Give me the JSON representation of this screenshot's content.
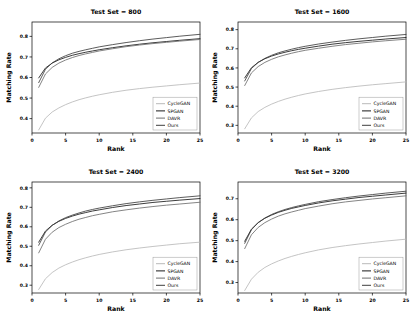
{
  "figure": {
    "type": "multi-panel-line-chart",
    "panel_count": 4,
    "layout": "2x2",
    "background": "#ffffff"
  },
  "axis": {
    "xlabel": "Rank",
    "ylabel": "Matching Rate",
    "xticks": [
      "0",
      "5",
      "10",
      "15",
      "20",
      "25"
    ],
    "xlim": [
      0,
      25
    ]
  },
  "legend": {
    "position": "lower-right",
    "entries": [
      {
        "label": "CycleGAN",
        "color": "#b9b9b9"
      },
      {
        "label": "SPGAN",
        "color": "#1a1a1a"
      },
      {
        "label": "DAVR",
        "color": "#6e6e6e"
      },
      {
        "label": "Ours",
        "color": "#3f3f3f"
      }
    ]
  },
  "chart_data": [
    {
      "type": "line",
      "title": "Test Set = 800",
      "xlabel": "Rank",
      "ylabel": "Matching Rate",
      "xlim": [
        0,
        25
      ],
      "ylim": [
        0.33,
        0.87
      ],
      "yticks": [
        0.4,
        0.5,
        0.6,
        0.7,
        0.8
      ],
      "ytick_labels": [
        "0.4",
        "0.5",
        "0.6",
        "0.7",
        "0.8"
      ],
      "grid": false,
      "x": [
        1,
        2,
        3,
        4,
        5,
        6,
        7,
        8,
        9,
        10,
        12,
        14,
        16,
        18,
        20,
        22,
        25
      ],
      "series": [
        {
          "name": "CycleGAN",
          "color": "#b9b9b9",
          "values": [
            0.345,
            0.402,
            0.432,
            0.452,
            0.468,
            0.481,
            0.492,
            0.501,
            0.509,
            0.516,
            0.528,
            0.538,
            0.546,
            0.553,
            0.559,
            0.565,
            0.573
          ]
        },
        {
          "name": "SPGAN",
          "color": "#1a1a1a",
          "values": [
            0.598,
            0.646,
            0.67,
            0.686,
            0.698,
            0.708,
            0.716,
            0.723,
            0.729,
            0.735,
            0.745,
            0.754,
            0.762,
            0.769,
            0.775,
            0.781,
            0.789
          ]
        },
        {
          "name": "DAVR",
          "color": "#6e6e6e",
          "values": [
            0.552,
            0.617,
            0.649,
            0.67,
            0.685,
            0.697,
            0.707,
            0.715,
            0.722,
            0.729,
            0.74,
            0.75,
            0.758,
            0.765,
            0.771,
            0.777,
            0.785
          ]
        },
        {
          "name": "Ours",
          "color": "#3f3f3f",
          "values": [
            0.575,
            0.64,
            0.671,
            0.691,
            0.706,
            0.718,
            0.727,
            0.735,
            0.742,
            0.749,
            0.76,
            0.77,
            0.779,
            0.787,
            0.794,
            0.801,
            0.81
          ]
        }
      ]
    },
    {
      "type": "line",
      "title": "Test Set = 1600",
      "xlabel": "Rank",
      "ylabel": "Matching Rate",
      "xlim": [
        0,
        25
      ],
      "ylim": [
        0.26,
        0.84
      ],
      "yticks": [
        0.3,
        0.4,
        0.5,
        0.6,
        0.7,
        0.8
      ],
      "ytick_labels": [
        "0.3",
        "0.4",
        "0.5",
        "0.6",
        "0.7",
        "0.8"
      ],
      "grid": false,
      "x": [
        1,
        2,
        3,
        4,
        5,
        6,
        7,
        8,
        9,
        10,
        12,
        14,
        16,
        18,
        20,
        22,
        25
      ],
      "series": [
        {
          "name": "CycleGAN",
          "color": "#b9b9b9",
          "values": [
            0.282,
            0.339,
            0.372,
            0.394,
            0.411,
            0.425,
            0.437,
            0.447,
            0.456,
            0.464,
            0.477,
            0.488,
            0.497,
            0.505,
            0.512,
            0.518,
            0.527
          ]
        },
        {
          "name": "SPGAN",
          "color": "#1a1a1a",
          "values": [
            0.548,
            0.601,
            0.629,
            0.648,
            0.662,
            0.673,
            0.682,
            0.69,
            0.697,
            0.703,
            0.714,
            0.724,
            0.732,
            0.739,
            0.745,
            0.751,
            0.759
          ]
        },
        {
          "name": "DAVR",
          "color": "#6e6e6e",
          "values": [
            0.508,
            0.574,
            0.607,
            0.629,
            0.645,
            0.658,
            0.668,
            0.677,
            0.685,
            0.692,
            0.703,
            0.713,
            0.722,
            0.729,
            0.736,
            0.742,
            0.75
          ]
        },
        {
          "name": "Ours",
          "color": "#3f3f3f",
          "values": [
            0.532,
            0.597,
            0.629,
            0.65,
            0.666,
            0.679,
            0.689,
            0.698,
            0.706,
            0.713,
            0.725,
            0.735,
            0.744,
            0.752,
            0.759,
            0.766,
            0.775
          ]
        }
      ]
    },
    {
      "type": "line",
      "title": "Test Set = 2400",
      "xlabel": "Rank",
      "ylabel": "Matching Rate",
      "xlim": [
        0,
        25
      ],
      "ylim": [
        0.26,
        0.83
      ],
      "yticks": [
        0.3,
        0.4,
        0.5,
        0.6,
        0.7,
        0.8
      ],
      "ytick_labels": [
        "0.3",
        "0.4",
        "0.5",
        "0.6",
        "0.7",
        "0.8"
      ],
      "grid": false,
      "x": [
        1,
        2,
        3,
        4,
        5,
        6,
        7,
        8,
        9,
        10,
        12,
        14,
        16,
        18,
        20,
        22,
        25
      ],
      "series": [
        {
          "name": "CycleGAN",
          "color": "#b9b9b9",
          "values": [
            0.278,
            0.333,
            0.365,
            0.388,
            0.405,
            0.419,
            0.431,
            0.441,
            0.45,
            0.458,
            0.471,
            0.482,
            0.491,
            0.499,
            0.506,
            0.513,
            0.521
          ]
        },
        {
          "name": "SPGAN",
          "color": "#1a1a1a",
          "values": [
            0.521,
            0.578,
            0.608,
            0.628,
            0.643,
            0.655,
            0.665,
            0.673,
            0.681,
            0.687,
            0.699,
            0.709,
            0.717,
            0.725,
            0.731,
            0.737,
            0.745
          ]
        },
        {
          "name": "DAVR",
          "color": "#6e6e6e",
          "values": [
            0.466,
            0.536,
            0.572,
            0.596,
            0.613,
            0.627,
            0.639,
            0.648,
            0.657,
            0.664,
            0.677,
            0.687,
            0.696,
            0.704,
            0.711,
            0.717,
            0.726
          ]
        },
        {
          "name": "Ours",
          "color": "#3f3f3f",
          "values": [
            0.505,
            0.573,
            0.607,
            0.63,
            0.647,
            0.66,
            0.671,
            0.681,
            0.689,
            0.696,
            0.708,
            0.719,
            0.728,
            0.736,
            0.743,
            0.75,
            0.759
          ]
        }
      ]
    },
    {
      "type": "line",
      "title": "Test Set = 3200",
      "xlabel": "Rank",
      "ylabel": "Matching Rate",
      "xlim": [
        0,
        25
      ],
      "ylim": [
        0.25,
        0.78
      ],
      "yticks": [
        0.3,
        0.4,
        0.5,
        0.6,
        0.7
      ],
      "ytick_labels": [
        "0.3",
        "0.4",
        "0.5",
        "0.6",
        "0.7"
      ],
      "grid": false,
      "x": [
        1,
        2,
        3,
        4,
        5,
        6,
        7,
        8,
        9,
        10,
        12,
        14,
        16,
        18,
        20,
        22,
        25
      ],
      "series": [
        {
          "name": "CycleGAN",
          "color": "#b9b9b9",
          "values": [
            0.262,
            0.316,
            0.349,
            0.372,
            0.389,
            0.403,
            0.415,
            0.425,
            0.434,
            0.442,
            0.456,
            0.467,
            0.476,
            0.484,
            0.491,
            0.498,
            0.507
          ]
        },
        {
          "name": "SPGAN",
          "color": "#1a1a1a",
          "values": [
            0.497,
            0.555,
            0.586,
            0.607,
            0.622,
            0.635,
            0.645,
            0.654,
            0.661,
            0.668,
            0.68,
            0.69,
            0.698,
            0.706,
            0.712,
            0.718,
            0.727
          ]
        },
        {
          "name": "DAVR",
          "color": "#6e6e6e",
          "values": [
            0.462,
            0.528,
            0.563,
            0.586,
            0.603,
            0.617,
            0.628,
            0.637,
            0.645,
            0.653,
            0.665,
            0.676,
            0.685,
            0.692,
            0.699,
            0.705,
            0.714
          ]
        },
        {
          "name": "Ours",
          "color": "#3f3f3f",
          "values": [
            0.487,
            0.552,
            0.586,
            0.608,
            0.625,
            0.638,
            0.649,
            0.658,
            0.666,
            0.673,
            0.686,
            0.696,
            0.705,
            0.713,
            0.72,
            0.727,
            0.736
          ]
        }
      ]
    }
  ]
}
